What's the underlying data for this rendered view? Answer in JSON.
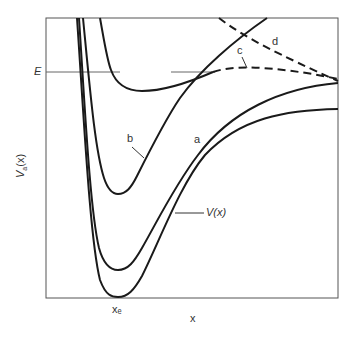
{
  "figure": {
    "y_axis_label_main": "V",
    "y_axis_label_sub": "a",
    "y_axis_label_tail": "(x)",
    "x_axis_label": "x",
    "energy_label": "E",
    "equilibrium_label": "xₑ",
    "curve_labels": {
      "a": "a",
      "b": "b",
      "c": "c",
      "d": "d",
      "potential": "V(x)"
    },
    "caption_fragment": ""
  },
  "colors": {
    "curve": "#1a1a1a",
    "frame": "#555555",
    "energy_line": "#666666"
  }
}
